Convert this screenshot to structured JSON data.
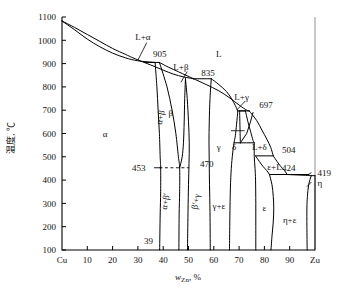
{
  "figure": {
    "system": "Cu-Zn",
    "y_axis_label": "温度, ℃",
    "x_axis_label_main": "w",
    "x_axis_label_sub": "Zn",
    "x_axis_label_tail": ", %"
  },
  "axes": {
    "y_ticks": [
      "1100",
      "1000",
      "900",
      "800",
      "700",
      "600",
      "500",
      "400",
      "300",
      "200",
      "100"
    ],
    "y_min": 100,
    "y_max": 1100,
    "x_ticks": [
      "Cu",
      "10",
      "20",
      "30",
      "40",
      "50",
      "60",
      "70",
      "80",
      "90",
      "Zn"
    ],
    "x_tick_display": [
      "Cu",
      "10",
      "20",
      "30",
      "40",
      "50",
      "60",
      "70",
      "80",
      "90",
      "Zu"
    ],
    "x_min": 0,
    "x_max": 100
  },
  "invariant_temperatures": [
    {
      "label": "905",
      "value": 905
    },
    {
      "label": "835",
      "value": 835
    },
    {
      "label": "697",
      "value": 697
    },
    {
      "label": "504",
      "value": 504
    },
    {
      "label": "424",
      "value": 424
    },
    {
      "label": "419",
      "value": 419
    },
    {
      "label": "470",
      "value": 470
    },
    {
      "label": "453",
      "value": 453
    },
    {
      "label": "39",
      "value": 39
    }
  ],
  "phase_labels": [
    {
      "text": "L",
      "name": "liquid"
    },
    {
      "text": "L+α",
      "name": "liquid-plus-alpha"
    },
    {
      "text": "L+β",
      "name": "liquid-plus-beta"
    },
    {
      "text": "L+γ",
      "name": "liquid-plus-gamma"
    },
    {
      "text": "L+δ",
      "name": "liquid-plus-delta"
    },
    {
      "text": "ε+L",
      "name": "epsilon-plus-liquid"
    },
    {
      "text": "α",
      "name": "alpha"
    },
    {
      "text": "β",
      "name": "beta"
    },
    {
      "text": "γ",
      "name": "gamma"
    },
    {
      "text": "δ",
      "name": "delta"
    },
    {
      "text": "ε",
      "name": "epsilon"
    },
    {
      "text": "η",
      "name": "eta"
    },
    {
      "text": "α+β",
      "name": "alpha-plus-beta"
    },
    {
      "text": "α+β′",
      "name": "alpha-plus-beta-prime"
    },
    {
      "text": "β′+γ",
      "name": "beta-prime-plus-gamma"
    },
    {
      "text": "γ+ε",
      "name": "gamma-plus-epsilon"
    },
    {
      "text": "η+ε",
      "name": "eta-plus-epsilon"
    }
  ],
  "chart_data": {
    "type": "line",
    "xlabel": "wZn, %",
    "ylabel": "温度, ℃",
    "xlim": [
      0,
      100
    ],
    "ylim": [
      100,
      1100
    ],
    "grid": false,
    "legend": "none",
    "x_tick_values": [
      0,
      10,
      20,
      30,
      40,
      50,
      60,
      70,
      80,
      90,
      100
    ],
    "x_tick_labels": [
      "Cu",
      "10",
      "20",
      "30",
      "40",
      "50",
      "60",
      "70",
      "80",
      "90",
      "Zn"
    ],
    "y_tick_values": [
      100,
      200,
      300,
      400,
      500,
      600,
      700,
      800,
      900,
      1000,
      1100
    ],
    "series": [
      {
        "name": "liquidus-Cu-to-905",
        "points": [
          [
            0,
            1083
          ],
          [
            5,
            1055
          ],
          [
            10,
            1025
          ],
          [
            15,
            995
          ],
          [
            20,
            965
          ],
          [
            25,
            940
          ],
          [
            28,
            925
          ],
          [
            32.5,
            905
          ]
        ]
      },
      {
        "name": "solidus-alpha-Cu-to-905",
        "points": [
          [
            0,
            1083
          ],
          [
            5,
            1045
          ],
          [
            10,
            1005
          ],
          [
            15,
            972
          ],
          [
            20,
            945
          ],
          [
            25,
            925
          ],
          [
            30,
            912
          ],
          [
            36.8,
            905
          ]
        ]
      },
      {
        "name": "peritectic-905",
        "points": [
          [
            32.5,
            905
          ],
          [
            36.8,
            905
          ],
          [
            38.5,
            905
          ]
        ]
      },
      {
        "name": "liquidus-905-to-835",
        "points": [
          [
            32.5,
            905
          ],
          [
            36,
            890
          ],
          [
            40,
            872
          ],
          [
            44,
            855
          ],
          [
            48,
            843
          ],
          [
            52,
            835
          ]
        ]
      },
      {
        "name": "beta-solidus-905-to-835",
        "points": [
          [
            38.5,
            905
          ],
          [
            42,
            885
          ],
          [
            46,
            865
          ],
          [
            49,
            850
          ],
          [
            52,
            835
          ]
        ]
      },
      {
        "name": "peritectic-835",
        "points": [
          [
            52,
            835
          ],
          [
            57,
            835
          ],
          [
            59,
            835
          ]
        ]
      },
      {
        "name": "liquidus-835-to-697",
        "points": [
          [
            52,
            835
          ],
          [
            57,
            810
          ],
          [
            62,
            783
          ],
          [
            66,
            755
          ],
          [
            70,
            722
          ],
          [
            73,
            700
          ],
          [
            74,
            697
          ]
        ]
      },
      {
        "name": "gamma-solidus-835-to-697",
        "points": [
          [
            59,
            835
          ],
          [
            62,
            810
          ],
          [
            65,
            780
          ],
          [
            67,
            750
          ],
          [
            68.5,
            720
          ],
          [
            69.5,
            697
          ]
        ]
      },
      {
        "name": "peritectic-697",
        "points": [
          [
            69.5,
            697
          ],
          [
            74,
            697
          ]
        ]
      },
      {
        "name": "liquidus-697-to-504",
        "points": [
          [
            74,
            697
          ],
          [
            77,
            655
          ],
          [
            79,
            615
          ],
          [
            81,
            575
          ],
          [
            82.5,
            540
          ],
          [
            83.5,
            504
          ]
        ]
      },
      {
        "name": "delta-solidus-697-to-560",
        "points": [
          [
            72.5,
            697
          ],
          [
            73.5,
            650
          ],
          [
            74.5,
            610
          ],
          [
            75.5,
            570
          ],
          [
            76,
            560
          ]
        ]
      },
      {
        "name": "peritectic-504",
        "points": [
          [
            76.5,
            504
          ],
          [
            83.5,
            504
          ]
        ]
      },
      {
        "name": "liquidus-504-to-424",
        "points": [
          [
            83.5,
            504
          ],
          [
            85,
            480
          ],
          [
            86.5,
            458
          ],
          [
            88,
            440
          ],
          [
            89,
            424
          ]
        ]
      },
      {
        "name": "epsilon-solidus-504-to-424",
        "points": [
          [
            76.5,
            504
          ],
          [
            78,
            480
          ],
          [
            79.5,
            458
          ],
          [
            81,
            440
          ],
          [
            82,
            424
          ]
        ]
      },
      {
        "name": "eutectoid-424",
        "points": [
          [
            82,
            424
          ],
          [
            89,
            424
          ],
          [
            97.5,
            424
          ]
        ]
      },
      {
        "name": "liquidus-424-to-419",
        "points": [
          [
            89,
            424
          ],
          [
            93,
            422
          ],
          [
            97,
            420
          ],
          [
            98.5,
            419
          ]
        ]
      },
      {
        "name": "zinc-melting-419",
        "points": [
          [
            98.5,
            419
          ],
          [
            100,
            419
          ]
        ]
      },
      {
        "name": "alpha-solvus",
        "points": [
          [
            36.8,
            905
          ],
          [
            37.5,
            800
          ],
          [
            38,
            700
          ],
          [
            38.5,
            600
          ],
          [
            38.8,
            500
          ],
          [
            39,
            453
          ],
          [
            39,
            350
          ],
          [
            38.8,
            250
          ],
          [
            38.6,
            100
          ]
        ]
      },
      {
        "name": "alpha-beta-boundary",
        "points": [
          [
            38.5,
            905
          ],
          [
            41.5,
            800
          ],
          [
            43.5,
            700
          ],
          [
            45,
            600
          ],
          [
            46,
            500
          ],
          [
            46.5,
            453
          ],
          [
            46.5,
            350
          ],
          [
            46.3,
            250
          ],
          [
            46.2,
            100
          ]
        ]
      },
      {
        "name": "beta-gamma-boundary-left",
        "points": [
          [
            46.5,
            453
          ],
          [
            47.5,
            500
          ],
          [
            48,
            560
          ],
          [
            48.3,
            650
          ],
          [
            48.5,
            750
          ],
          [
            48.8,
            835
          ]
        ]
      },
      {
        "name": "beta-prime-gamma-right",
        "points": [
          [
            48.8,
            835
          ],
          [
            49.5,
            750
          ],
          [
            50,
            650
          ],
          [
            50.3,
            560
          ],
          [
            50.2,
            470
          ],
          [
            50,
            380
          ],
          [
            49.8,
            260
          ],
          [
            49.6,
            100
          ]
        ]
      },
      {
        "name": "gamma-left-boundary",
        "points": [
          [
            59,
            835
          ],
          [
            58.5,
            750
          ],
          [
            58.2,
            650
          ],
          [
            58.1,
            560
          ],
          [
            58.2,
            470
          ],
          [
            58.3,
            380
          ],
          [
            58.5,
            260
          ],
          [
            58.6,
            100
          ]
        ]
      },
      {
        "name": "gamma-right-boundary",
        "points": [
          [
            69.5,
            697
          ],
          [
            69,
            640
          ],
          [
            68.5,
            590
          ],
          [
            68,
            560
          ],
          [
            67.3,
            500
          ],
          [
            66.8,
            430
          ],
          [
            66.5,
            340
          ],
          [
            66.3,
            200
          ],
          [
            66.2,
            100
          ]
        ]
      },
      {
        "name": "delta-eutectoid-560",
        "points": [
          [
            70.5,
            560
          ],
          [
            73,
            560
          ],
          [
            76,
            560
          ]
        ]
      },
      {
        "name": "delta-left-boundary",
        "points": [
          [
            70.2,
            697
          ],
          [
            70.3,
            650
          ],
          [
            70.4,
            600
          ],
          [
            70.5,
            560
          ]
        ]
      },
      {
        "name": "delta-triangle-top",
        "points": [
          [
            70.2,
            697
          ],
          [
            72.5,
            697
          ]
        ]
      },
      {
        "name": "delta-inner-slant",
        "points": [
          [
            70.5,
            560
          ],
          [
            73,
            600
          ],
          [
            74.5,
            650
          ],
          [
            75.5,
            690
          ]
        ]
      },
      {
        "name": "gamma-epsilon-peak",
        "points": [
          [
            68,
            560
          ],
          [
            70.5,
            560
          ]
        ]
      },
      {
        "name": "epsilon-left-boundary",
        "points": [
          [
            76,
            560
          ],
          [
            76,
            500
          ],
          [
            76.3,
            450
          ],
          [
            76.5,
            400
          ],
          [
            76.6,
            300
          ],
          [
            76.6,
            200
          ],
          [
            76.6,
            100
          ]
        ]
      },
      {
        "name": "epsilon-right-boundary",
        "points": [
          [
            82,
            424
          ],
          [
            83,
            380
          ],
          [
            83.5,
            330
          ],
          [
            83.7,
            280
          ],
          [
            83.5,
            220
          ],
          [
            83,
            160
          ],
          [
            82.6,
            100
          ]
        ]
      },
      {
        "name": "eta-solvus",
        "points": [
          [
            98.5,
            419
          ],
          [
            97.5,
            380
          ],
          [
            97,
            330
          ],
          [
            96.8,
            280
          ],
          [
            96.8,
            200
          ],
          [
            96.9,
            100
          ]
        ]
      },
      {
        "name": "zinc-edge",
        "points": [
          [
            100,
            419
          ],
          [
            100,
            100
          ]
        ]
      }
    ],
    "annotations": [
      {
        "text": "905",
        "x": 36,
        "y": 940
      },
      {
        "text": "835",
        "x": 55,
        "y": 862
      },
      {
        "text": "697",
        "x": 78,
        "y": 723
      },
      {
        "text": "504",
        "x": 87,
        "y": 530
      },
      {
        "text": "424",
        "x": 87,
        "y": 452
      },
      {
        "text": "419",
        "x": 101,
        "y": 430
      },
      {
        "text": "470",
        "x": 54.5,
        "y": 470
      },
      {
        "text": "453",
        "x": 33,
        "y": 453
      },
      {
        "text": "39",
        "x": 36,
        "y": 140
      },
      {
        "text": "L",
        "x": 62,
        "y": 940
      },
      {
        "text": "L+α",
        "x": 32,
        "y": 1015
      },
      {
        "text": "L+β",
        "x": 47,
        "y": 885
      },
      {
        "text": "L+γ",
        "x": 71,
        "y": 757
      },
      {
        "text": "L+δ",
        "x": 78,
        "y": 545
      },
      {
        "text": "ε+L",
        "x": 84,
        "y": 455
      },
      {
        "text": "α",
        "x": 17,
        "y": 600
      },
      {
        "text": "β",
        "x": 43,
        "y": 690
      },
      {
        "text": "γ",
        "x": 62,
        "y": 545
      },
      {
        "text": "δ",
        "x": 68,
        "y": 545
      },
      {
        "text": "ε",
        "x": 80,
        "y": 280
      },
      {
        "text": "η",
        "x": 101,
        "y": 390
      },
      {
        "text": "α+β",
        "x": 40,
        "y": 680
      },
      {
        "text": "α+β′",
        "x": 42,
        "y": 320
      },
      {
        "text": "β′+γ",
        "x": 54,
        "y": 320
      },
      {
        "text": "γ+ε",
        "x": 62,
        "y": 290
      },
      {
        "text": "η+ε",
        "x": 90,
        "y": 230
      }
    ]
  }
}
